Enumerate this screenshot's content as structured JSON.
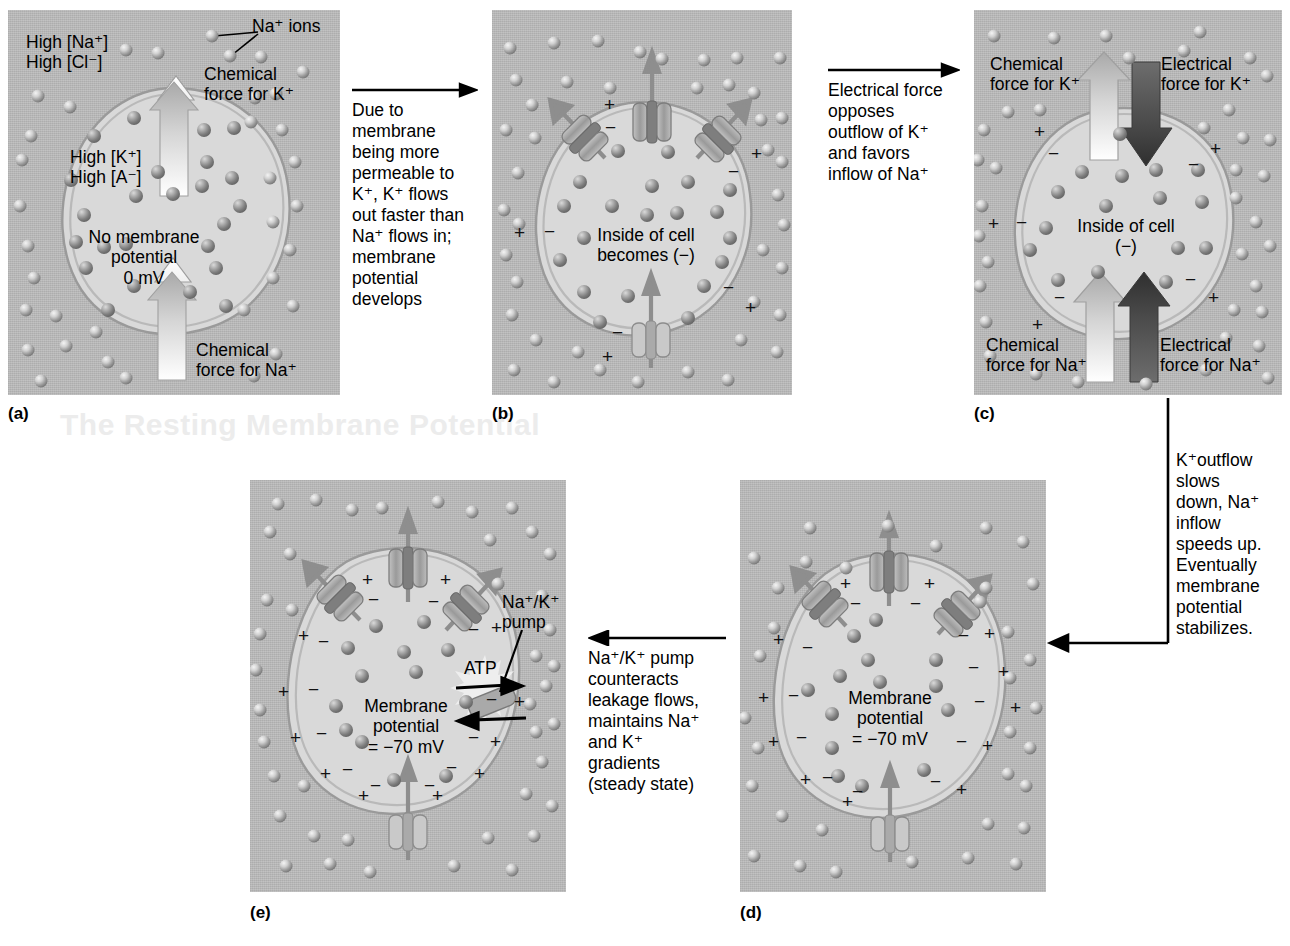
{
  "figure": {
    "type": "process-diagram",
    "panel_count": 5
  },
  "panels": [
    {
      "id": "a",
      "label": "(a)",
      "callout": "Na⁺ ions",
      "texts": {
        "outside_conc": "High [Na⁺]\nHigh [Cl⁻]",
        "inside_conc": "High [K⁺]\nHigh [A⁻]",
        "center": "No membrane\npotential\n0 mV",
        "arrow_k": "Chemical\nforce for K⁺",
        "arrow_na": "Chemical\nforce for Na⁺"
      }
    },
    {
      "id": "b",
      "label": "(b)",
      "texts": {
        "center": "Inside of cell\nbecomes (−)"
      }
    },
    {
      "id": "c",
      "label": "(c)",
      "texts": {
        "center": "Inside of cell\n(−)",
        "chem_k": "Chemical\nforce for K⁺",
        "elec_k": "Electrical\nforce for K⁺",
        "chem_na": "Chemical\nforce for Na⁺",
        "elec_na": "Electrical\nforce for Na⁺"
      }
    },
    {
      "id": "d",
      "label": "(d)",
      "texts": {
        "center": "Membrane\npotential\n= −70 mV"
      }
    },
    {
      "id": "e",
      "label": "(e)",
      "texts": {
        "center": "Membrane\npotential\n= −70 mV",
        "pump": "Na⁺/K⁺\npump",
        "atp": "ATP"
      }
    }
  ],
  "transitions": [
    {
      "from": "a",
      "to": "b",
      "direction": "right",
      "text": "Due to\nmembrane\nbeing more\npermeable to\nK⁺, K⁺ flows\nout faster than\nNa⁺ flows in;\nmembrane\npotential\ndevelops"
    },
    {
      "from": "b",
      "to": "c",
      "direction": "right",
      "text": "Electrical force\nopposes\noutflow of K⁺\nand favors\ninflow of Na⁺"
    },
    {
      "from": "c",
      "to": "d",
      "direction": "elbow-down-left",
      "text": "K⁺outflow slows\ndown, Na⁺ inflow\nspeeds up.\nEventually\nmembrane\npotential stabilizes."
    },
    {
      "from": "d",
      "to": "e",
      "direction": "left",
      "text": "Na⁺/K⁺ pump\ncounteracts\nleakage flows,\nmaintains Na⁺\nand K⁺\ngradients\n(steady state)"
    }
  ],
  "colors": {
    "extracellular_fluid": "#b6b6b6",
    "cytosol": "#d9d9d9",
    "membrane": "#9a9a9a",
    "chemical_force_arrow": "#b9b9b9",
    "electrical_force_arrow": "#4a4a4a",
    "leak_arrow": "#8e8e8e",
    "channel_protein": "#9c9c9c",
    "text": "#000000"
  },
  "legend": {
    "chemical_force": "light arrow",
    "electrical_force": "dark arrow",
    "channel": "ion channel protein",
    "pump": "Na⁺/K⁺ ATPase pump"
  }
}
